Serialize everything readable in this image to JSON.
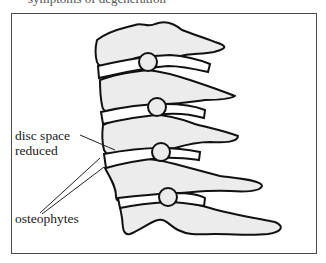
{
  "caption_top_cut": "symptoms of degeneration",
  "labels": {
    "disc_space_line1": "disc space",
    "disc_space_line2": "reduced",
    "osteophytes": "osteophytes"
  },
  "colors": {
    "bone_fill": "#ececec",
    "outline": "#111111",
    "frame": "#4a4a4a",
    "disc_fill": "#ffffff"
  },
  "figure": {
    "vertebrae_count": 5,
    "discs_count": 4
  }
}
